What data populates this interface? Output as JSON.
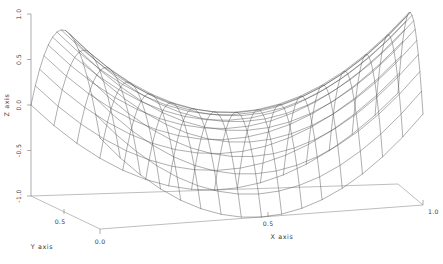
{
  "figure": {
    "background_color": "#ffffff",
    "line_color": "#4d4d4d",
    "axis_color": "#8a8a8a",
    "text_color": "#3a3a3a",
    "title": ""
  },
  "chart_data": {
    "type": "line",
    "plot_kind": "3d-wireframe-surface",
    "surface_name": "hyperbolic-paraboloid",
    "title": "",
    "xlabel": "X axis",
    "ylabel": "Y axis",
    "zlabel": "Z axis",
    "xlim": [
      0.0,
      1.0
    ],
    "ylim": [
      0.0,
      1.0
    ],
    "zlim": [
      -1.0,
      1.0
    ],
    "grid": false,
    "legend": false,
    "x_ticks": [
      "0.5",
      "1.0"
    ],
    "x_tick_values": [
      0.5,
      1.0
    ],
    "y_ticks": [
      "0.5",
      "0.0"
    ],
    "y_tick_values": [
      0.5,
      0.0
    ],
    "z_ticks": [
      "1.0",
      "0.5",
      "0.0",
      "-0.5",
      "-1.0"
    ],
    "z_tick_values": [
      1.0,
      0.5,
      0.0,
      -0.5,
      -1.0
    ],
    "mesh_rows": 16,
    "mesh_cols": 16,
    "z_formula": "z = (2x-1)^2 - (2y-1)^2",
    "corner_values": [
      {
        "x": 0.0,
        "y": 0.0,
        "z": 0.0
      },
      {
        "x": 1.0,
        "y": 0.0,
        "z": 1.0
      },
      {
        "x": 0.0,
        "y": 1.0,
        "z": -1.0
      },
      {
        "x": 1.0,
        "y": 1.0,
        "z": 0.0
      }
    ],
    "sample_points": [
      {
        "x": 0.0,
        "y": 0.0,
        "z": 0.0
      },
      {
        "x": 0.25,
        "y": 0.0,
        "z": 0.25
      },
      {
        "x": 0.5,
        "y": 0.0,
        "z": 1.0
      },
      {
        "x": 0.5,
        "y": 0.5,
        "z": 0.0
      },
      {
        "x": 0.5,
        "y": 1.0,
        "z": -1.0
      },
      {
        "x": 1.0,
        "y": 0.5,
        "z": 0.0
      },
      {
        "x": 1.0,
        "y": 1.0,
        "z": 0.0
      },
      {
        "x": 0.0,
        "y": 1.0,
        "z": -1.0
      },
      {
        "x": 0.0,
        "y": 0.5,
        "z": 0.0
      }
    ],
    "view": {
      "elevation_deg": 28,
      "azimuth_deg": -60,
      "projection": "orthographic"
    }
  },
  "labels": {
    "x_axis_title": "X axis",
    "y_axis_title": "Y axis",
    "z_axis_title": "Z axis",
    "x_tick_mid": "0.5",
    "x_tick_max": "1.0",
    "y_tick_mid": "0.5",
    "y_tick_min": "0.0",
    "z_tick_1": "1.0",
    "z_tick_2": "0.5",
    "z_tick_3": "0.0",
    "z_tick_4": "-0.5",
    "z_tick_5": "-1.0"
  }
}
